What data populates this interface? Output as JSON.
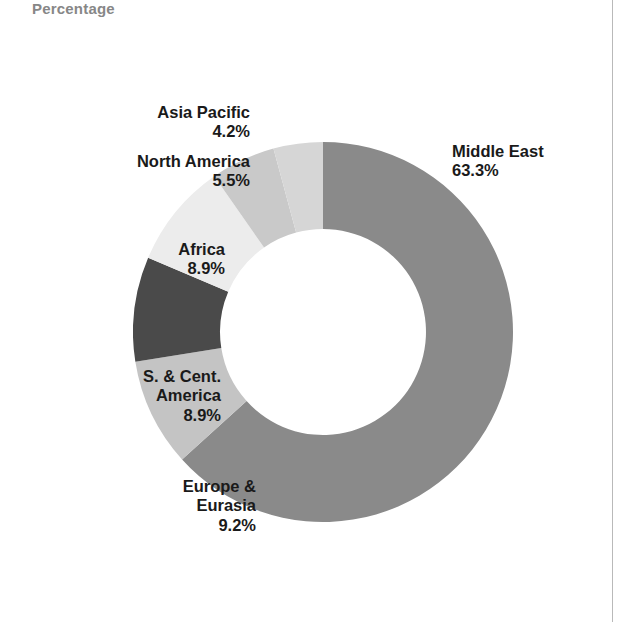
{
  "chart": {
    "title": "Percentage"
  },
  "labels": {
    "middle_east": "Middle East\n63.3%",
    "asia_pacific": "Asia Pacific\n4.2%",
    "north_america": "North America\n5.5%",
    "africa": "Africa\n8.9%",
    "s_cent_america": "S. & Cent.\nAmerica\n8.9%",
    "europe_eurasia": "Europe &\nEurasia\n9.2%"
  },
  "chart_data": {
    "type": "pie",
    "title": "Percentage",
    "subtitle": "",
    "xlabel": "",
    "ylabel": "",
    "variant": "donut",
    "units": "percent",
    "total": 100.0,
    "legend_position": "none",
    "labels_position": "outside",
    "grid": false,
    "start_angle_deg": 0,
    "direction": "clockwise",
    "inner_radius_ratio": 0.542,
    "categories": [
      "Middle East",
      "Europe & Eurasia",
      "S. & Cent. America",
      "Africa",
      "North America",
      "Asia Pacific"
    ],
    "values": [
      63.3,
      9.2,
      8.9,
      8.9,
      5.5,
      4.2
    ],
    "value_labels": [
      "63.3%",
      "9.2%",
      "8.9%",
      "8.9%",
      "5.5%",
      "4.2%"
    ],
    "colors": [
      "#8a8a8a",
      "#c4c4c4",
      "#4a4a4a",
      "#ececec",
      "#c9c9c9",
      "#d6d6d6"
    ],
    "slices": [
      {
        "name": "Middle East",
        "value": 63.3,
        "label": "63.3%",
        "color": "#8a8a8a"
      },
      {
        "name": "Europe & Eurasia",
        "value": 9.2,
        "label": "9.2%",
        "color": "#c4c4c4"
      },
      {
        "name": "S. & Cent. America",
        "value": 8.9,
        "label": "8.9%",
        "color": "#4a4a4a"
      },
      {
        "name": "Africa",
        "value": 8.9,
        "label": "8.9%",
        "color": "#ececec"
      },
      {
        "name": "North America",
        "value": 5.5,
        "label": "5.5%",
        "color": "#c9c9c9"
      },
      {
        "name": "Asia Pacific",
        "value": 4.2,
        "label": "4.2%",
        "color": "#d6d6d6"
      }
    ]
  },
  "style": {
    "title_color": "#878787",
    "label_color": "#1a1a1a",
    "background": "#ffffff",
    "rule_color": "#b9b9b9"
  }
}
